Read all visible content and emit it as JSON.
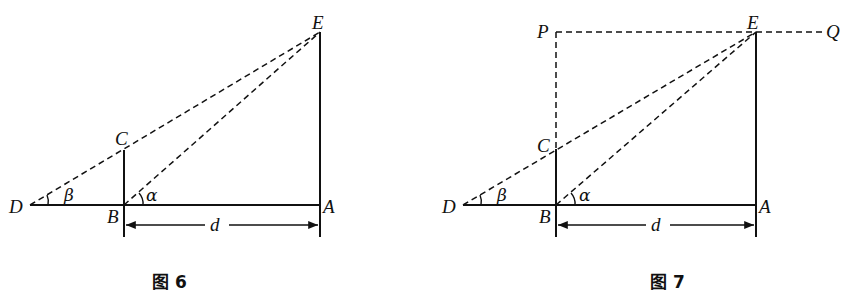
{
  "figures": [
    {
      "caption": "图 6",
      "points": {
        "D": "D",
        "B": "B",
        "A": "A",
        "C": "C",
        "E": "E"
      },
      "angles": {
        "alpha": "α",
        "beta": "β"
      },
      "distance_label": "d"
    },
    {
      "caption": "图 7",
      "points": {
        "D": "D",
        "B": "B",
        "A": "A",
        "C": "C",
        "E": "E",
        "P": "P",
        "Q": "Q"
      },
      "angles": {
        "alpha": "α",
        "beta": "β"
      },
      "distance_label": "d"
    }
  ]
}
